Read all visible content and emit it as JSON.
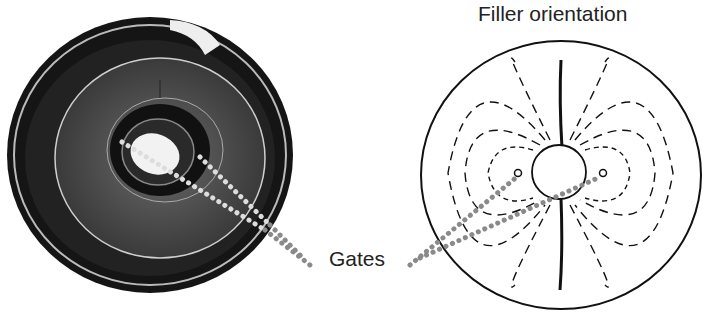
{
  "figure": {
    "title": "Filler orientation",
    "gate_label": "Gates",
    "left_panel": {
      "description": "Photograph of a molded disc part with central hub and two gate locations",
      "gate_count": 2
    },
    "right_panel": {
      "description": "Schematic of filler orientation flow lines around two gates and central hole, with weld lines top and bottom",
      "gate_count": 2
    },
    "colors": {
      "line": "#111111",
      "gate_dots": "#8a8a8a",
      "photo_dark": "#1a1a1a",
      "photo_mid": "#555555"
    }
  }
}
